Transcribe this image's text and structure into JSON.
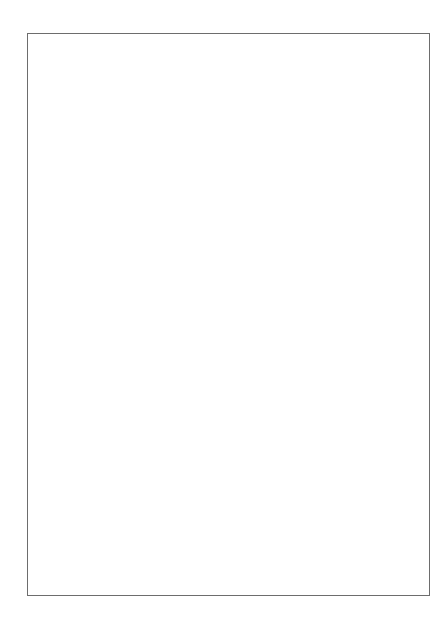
{
  "chart_data": {
    "type": "scatter",
    "title": "",
    "xlabel": "Year",
    "ylabel": "Per capita consumption (gallons)",
    "yscale": "log",
    "ylim": [
      0.1,
      10
    ],
    "xlim": [
      1959,
      2003
    ],
    "grid": false,
    "legend_position": "right-inline",
    "ytick_labels": [
      "10",
      "5",
      "3",
      "1",
      "0.5",
      "0.3",
      "0.1"
    ],
    "ytick_values": [
      10,
      5,
      3,
      1,
      0.5,
      0.3,
      0.1
    ],
    "yminor_values": [
      9,
      8,
      7,
      6,
      4,
      2,
      0.9,
      0.8,
      0.7,
      0.6,
      0.4,
      0.2
    ],
    "xtick_labels": [
      "1960",
      "1970",
      "1980",
      "1990",
      "2000"
    ],
    "xtick_values": [
      1960,
      1970,
      1980,
      1990,
      2000
    ],
    "x": [
      1960,
      1961,
      1962,
      1963,
      1964,
      1965,
      1966,
      1967,
      1968,
      1969,
      1970,
      1971,
      1972,
      1973,
      1974,
      1975,
      1976,
      1977,
      1978,
      1979,
      1980,
      1981,
      1982,
      1983,
      1984,
      1985,
      1986,
      1987,
      1988,
      1989,
      1990,
      1991,
      1992,
      1993,
      1994,
      1995,
      1996,
      1997,
      1998,
      1999,
      2000,
      2001,
      2002
    ],
    "series": [
      {
        "name": "Total",
        "marker": "triangle-down-filled",
        "label_value": 2.2,
        "values": [
          2.21,
          2.2,
          2.21,
          2.24,
          2.3,
          2.33,
          2.37,
          2.4,
          2.45,
          2.5,
          2.54,
          2.55,
          2.57,
          2.6,
          2.63,
          2.62,
          2.63,
          2.68,
          2.71,
          2.75,
          2.76,
          2.76,
          2.72,
          2.69,
          2.65,
          2.62,
          2.58,
          2.54,
          2.48,
          2.42,
          2.45,
          2.3,
          2.26,
          2.22,
          2.18,
          2.15,
          2.16,
          2.14,
          2.14,
          2.16,
          2.18,
          2.18,
          2.2
        ]
      },
      {
        "name": "Beer",
        "marker": "square-open",
        "label_value": 1.35,
        "values": [
          0.99,
          0.99,
          1.0,
          1.02,
          1.06,
          1.06,
          1.09,
          1.11,
          1.14,
          1.17,
          1.19,
          1.22,
          1.25,
          1.28,
          1.33,
          1.33,
          1.33,
          1.36,
          1.37,
          1.4,
          1.41,
          1.42,
          1.42,
          1.4,
          1.38,
          1.36,
          1.35,
          1.36,
          1.34,
          1.33,
          1.35,
          1.3,
          1.29,
          1.28,
          1.27,
          1.25,
          1.26,
          1.25,
          1.25,
          1.26,
          1.26,
          1.26,
          1.27
        ]
      },
      {
        "name": "Spirits",
        "marker": "triangle-up-filled",
        "label_value": 0.66,
        "values": [
          0.86,
          0.86,
          0.88,
          0.9,
          0.93,
          0.95,
          0.98,
          1.0,
          1.04,
          1.07,
          1.09,
          1.1,
          1.11,
          1.12,
          1.14,
          1.13,
          1.12,
          1.12,
          1.11,
          1.09,
          1.04,
          1.0,
          0.96,
          0.92,
          0.9,
          0.86,
          0.83,
          0.81,
          0.76,
          0.74,
          0.72,
          0.69,
          0.67,
          0.65,
          0.64,
          0.63,
          0.63,
          0.63,
          0.63,
          0.65,
          0.66,
          0.66,
          0.67
        ]
      },
      {
        "name": "Wine",
        "marker": "circle-open",
        "label_value": 0.335,
        "values": [
          0.22,
          0.22,
          0.225,
          0.23,
          0.235,
          0.24,
          0.245,
          0.25,
          0.26,
          0.26,
          0.267,
          0.31,
          0.31,
          0.31,
          0.313,
          0.315,
          0.296,
          0.315,
          0.325,
          0.34,
          0.345,
          0.355,
          0.36,
          0.37,
          0.375,
          0.385,
          0.39,
          0.39,
          0.375,
          0.36,
          0.34,
          0.31,
          0.305,
          0.295,
          0.285,
          0.29,
          0.295,
          0.3,
          0.31,
          0.315,
          0.315,
          0.32,
          0.34
        ]
      }
    ]
  },
  "style": {
    "marker_color": "#111111",
    "axis_color": "#6d6d6d",
    "text_color": "#3a3a3a",
    "background": "#ffffff"
  }
}
